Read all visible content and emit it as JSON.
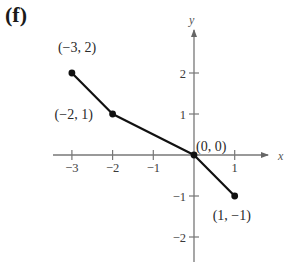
{
  "panel_label": "(f)",
  "chart_data": {
    "type": "line",
    "title": "",
    "xlabel": "x",
    "ylabel": "y",
    "xlim": [
      -3.5,
      1.8
    ],
    "ylim": [
      -2.5,
      3.2
    ],
    "grid": false,
    "x_ticks": [
      -3,
      -2,
      -1,
      1
    ],
    "x_tick_labels": [
      "−3",
      "−2",
      "−1",
      "1"
    ],
    "y_ticks": [
      2,
      1,
      -1,
      -2
    ],
    "y_tick_labels": [
      "2",
      "1",
      "−1",
      "−2"
    ],
    "series": [
      {
        "name": "piecewise",
        "x": [
          -3,
          -2,
          0,
          1
        ],
        "y": [
          2,
          1,
          0,
          -1
        ],
        "color": "#111111",
        "markers": true
      }
    ],
    "annotations": [
      {
        "text": "(−3,  2)",
        "x": -3,
        "y": 2
      },
      {
        "text": "(−2,  1)",
        "x": -2,
        "y": 1
      },
      {
        "text": "(0,  0)",
        "x": 0,
        "y": 0
      },
      {
        "text": "(1,  −1)",
        "x": 1,
        "y": -1
      }
    ]
  }
}
